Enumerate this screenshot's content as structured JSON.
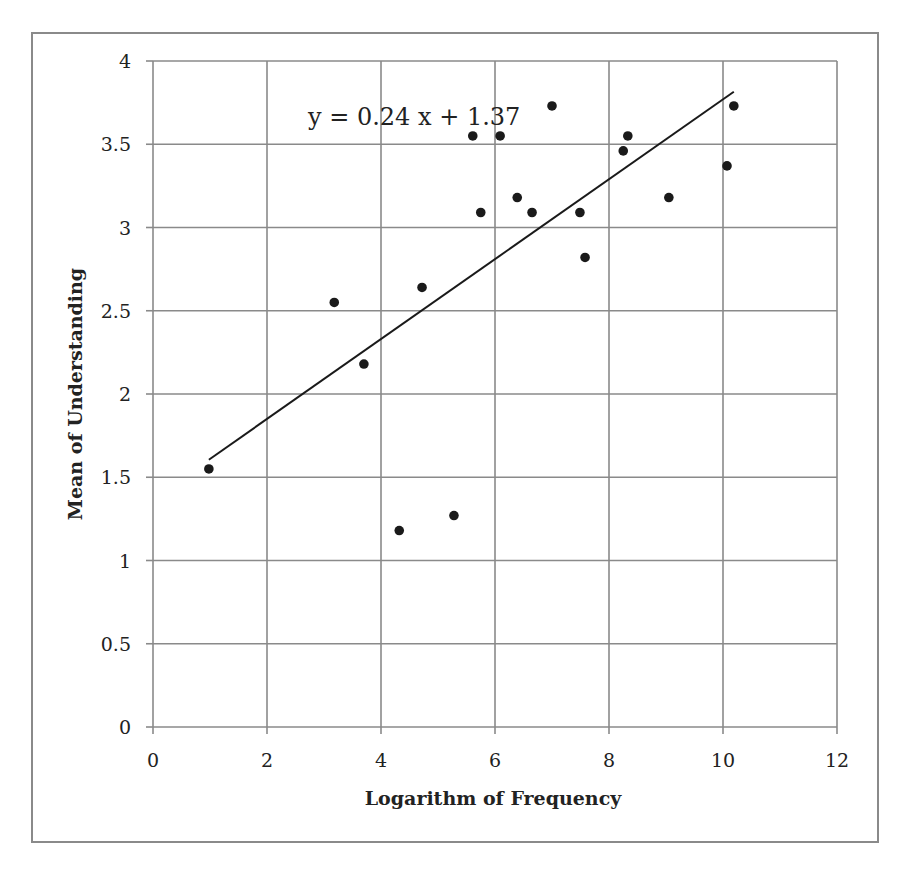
{
  "chart_data": {
    "type": "scatter",
    "title": "",
    "xlabel": "Logarithm of Frequency",
    "ylabel": "Mean of Understanding",
    "xlim": [
      0,
      12
    ],
    "ylim": [
      0,
      4
    ],
    "x_ticks": [
      0,
      2,
      4,
      6,
      8,
      10,
      12
    ],
    "y_ticks": [
      0,
      0.5,
      1,
      1.5,
      2,
      2.5,
      3,
      3.5,
      4
    ],
    "x_tick_labels": [
      "0",
      "2",
      "4",
      "6",
      "8",
      "10",
      "12"
    ],
    "y_tick_labels": [
      "0",
      "0.5",
      "1",
      "1.5",
      "2",
      "2.5",
      "3",
      "3.5",
      "4"
    ],
    "grid": true,
    "legend": null,
    "series": [
      {
        "name": "data",
        "marker": "filled-circle",
        "color": "#1a1a1a",
        "points": [
          {
            "x": 0.98,
            "y": 1.55
          },
          {
            "x": 3.18,
            "y": 2.55
          },
          {
            "x": 3.7,
            "y": 2.18
          },
          {
            "x": 4.32,
            "y": 1.18
          },
          {
            "x": 4.72,
            "y": 2.64
          },
          {
            "x": 5.28,
            "y": 1.27
          },
          {
            "x": 5.61,
            "y": 3.55
          },
          {
            "x": 5.75,
            "y": 3.09
          },
          {
            "x": 6.09,
            "y": 3.55
          },
          {
            "x": 6.39,
            "y": 3.18
          },
          {
            "x": 6.65,
            "y": 3.09
          },
          {
            "x": 7.0,
            "y": 3.73
          },
          {
            "x": 7.49,
            "y": 3.09
          },
          {
            "x": 7.58,
            "y": 2.82
          },
          {
            "x": 8.25,
            "y": 3.46
          },
          {
            "x": 8.33,
            "y": 3.55
          },
          {
            "x": 9.05,
            "y": 3.18
          },
          {
            "x": 10.07,
            "y": 3.37
          },
          {
            "x": 10.19,
            "y": 3.73
          }
        ]
      }
    ],
    "trendline": {
      "type": "linear",
      "slope": 0.24,
      "intercept": 1.37,
      "x_start": 0.98,
      "x_end": 10.19,
      "color": "#1a1a1a"
    },
    "annotations": [
      {
        "text": "y = 0.24 x + 1.37",
        "x": 2.75,
        "y": 3.67
      }
    ]
  },
  "colors": {
    "frame": "#8a8a8a",
    "grid": "#8a8a8a",
    "text": "#222222",
    "marker": "#1a1a1a"
  }
}
